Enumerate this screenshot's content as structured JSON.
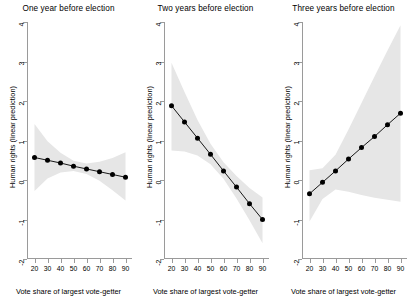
{
  "figure": {
    "width": 412,
    "height": 299,
    "background": "#ffffff",
    "line_color": "#000000",
    "marker_color": "#000000",
    "band_color": "#e6e6e6",
    "axis_color": "#9a9a9a"
  },
  "chart_data": [
    {
      "type": "line",
      "title": "One year before election",
      "xlabel": "Vote share of largest vote-getter",
      "ylabel": "Human rights (linear prediction)",
      "x": [
        20,
        30,
        40,
        50,
        60,
        70,
        80,
        90
      ],
      "values": [
        0.57,
        0.5,
        0.43,
        0.35,
        0.28,
        0.21,
        0.14,
        0.07
      ],
      "ci_lower": [
        -0.28,
        0.04,
        0.19,
        0.23,
        0.15,
        -0.02,
        -0.26,
        -0.52
      ],
      "ci_upper": [
        1.42,
        0.98,
        0.69,
        0.49,
        0.42,
        0.46,
        0.56,
        0.7
      ],
      "series": [
        {
          "name": "Linear prediction",
          "values": [
            0.57,
            0.5,
            0.43,
            0.35,
            0.28,
            0.21,
            0.14,
            0.07
          ]
        }
      ],
      "xlim": [
        15,
        95
      ],
      "ylim": [
        -2,
        4
      ],
      "xticks": [
        20,
        30,
        40,
        50,
        60,
        70,
        80,
        90
      ],
      "yticks": [
        4,
        3,
        2,
        1,
        0,
        -1,
        -2
      ],
      "grid": false,
      "legend": "none",
      "marker": "filled-circle"
    },
    {
      "type": "line",
      "title": "Two years before election",
      "xlabel": "Vote share of largest vote-getter",
      "ylabel": "Human rights (linear prediction)",
      "x": [
        20,
        30,
        40,
        50,
        60,
        70,
        80,
        90
      ],
      "values": [
        1.88,
        1.47,
        1.06,
        0.65,
        0.23,
        -0.18,
        -0.6,
        -1.0
      ],
      "ci_lower": [
        0.75,
        0.72,
        0.62,
        0.4,
        0.03,
        -0.47,
        -1.02,
        -1.6
      ],
      "ci_upper": [
        2.97,
        2.23,
        1.52,
        0.92,
        0.45,
        0.1,
        -0.2,
        -0.44
      ],
      "series": [
        {
          "name": "Linear prediction",
          "values": [
            1.88,
            1.47,
            1.06,
            0.65,
            0.23,
            -0.18,
            -0.6,
            -1.0
          ]
        }
      ],
      "xlim": [
        15,
        95
      ],
      "ylim": [
        -2,
        4
      ],
      "xticks": [
        20,
        30,
        40,
        50,
        60,
        70,
        80,
        90
      ],
      "yticks": [
        4,
        3,
        2,
        1,
        0,
        -1,
        -2
      ],
      "grid": false,
      "legend": "none",
      "marker": "filled-circle"
    },
    {
      "type": "line",
      "title": "Three years before election",
      "xlabel": "Vote share of largest vote-getter",
      "ylabel": "Human rights (linear prediction)",
      "x": [
        20,
        30,
        40,
        50,
        60,
        70,
        80,
        90
      ],
      "values": [
        -0.35,
        -0.06,
        0.23,
        0.53,
        0.82,
        1.1,
        1.4,
        1.69
      ],
      "ci_lower": [
        -1.05,
        -0.48,
        -0.24,
        -0.3,
        -0.38,
        -0.45,
        -0.5,
        -0.55
      ],
      "ci_upper": [
        0.25,
        0.3,
        0.64,
        1.28,
        1.95,
        2.62,
        3.28,
        3.92
      ],
      "series": [
        {
          "name": "Linear prediction",
          "values": [
            -0.35,
            -0.06,
            0.23,
            0.53,
            0.82,
            1.1,
            1.4,
            1.69
          ]
        }
      ],
      "xlim": [
        15,
        95
      ],
      "ylim": [
        -2,
        4
      ],
      "xticks": [
        20,
        30,
        40,
        50,
        60,
        70,
        80,
        90
      ],
      "yticks": [
        4,
        3,
        2,
        1,
        0,
        -1,
        -2
      ],
      "grid": false,
      "legend": "none",
      "marker": "filled-circle"
    }
  ]
}
